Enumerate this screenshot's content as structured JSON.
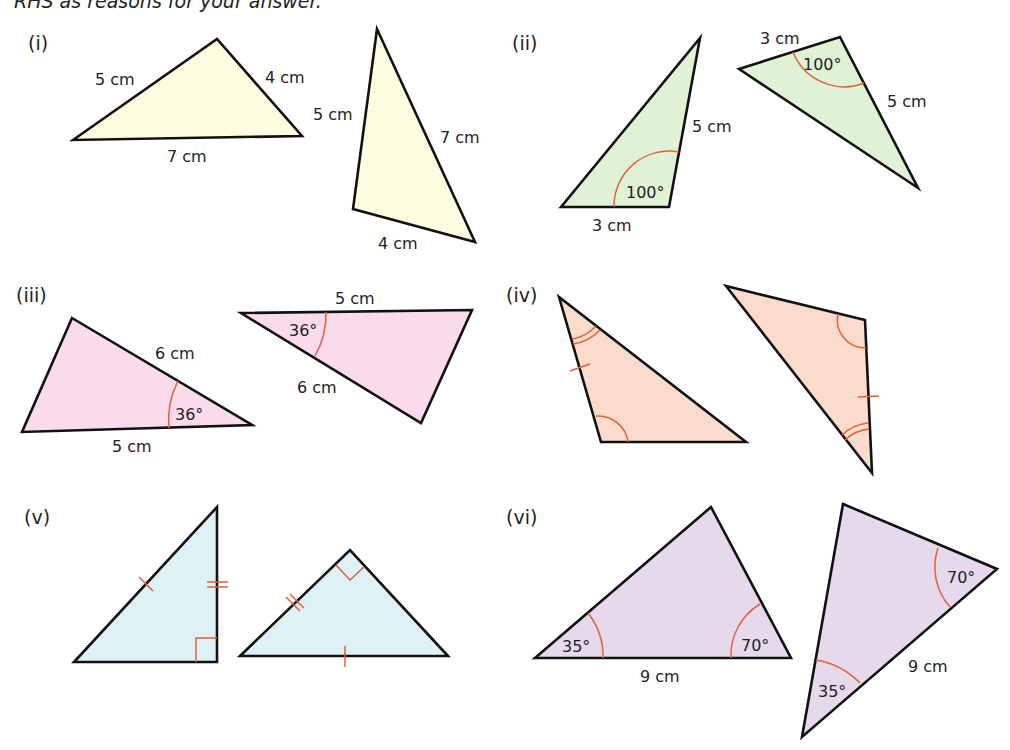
{
  "header": {
    "text": "RHS as reasons for your answer."
  },
  "colors": {
    "i": "#fdfbe0",
    "ii": "#dff2d6",
    "iii": "#f9dbec",
    "iv": "#fbdccc",
    "v": "#ddf1f7",
    "vi": "#e6d9ec",
    "edge": "#111111",
    "marker": "#e0603a"
  },
  "panels": {
    "i": {
      "label": "(i)",
      "t1": {
        "side_a": "5 cm",
        "side_b": "4 cm",
        "side_c": "7 cm"
      },
      "t2": {
        "side_a": "5 cm",
        "side_b": "7 cm",
        "side_c": "4 cm"
      }
    },
    "ii": {
      "label": "(ii)",
      "t1": {
        "side_a": "5 cm",
        "side_b": "3 cm",
        "angle": "100°"
      },
      "t2": {
        "side_a": "3 cm",
        "side_b": "5 cm",
        "angle": "100°"
      }
    },
    "iii": {
      "label": "(iii)",
      "t1": {
        "side_a": "6 cm",
        "side_b": "5 cm",
        "angle": "36°"
      },
      "t2": {
        "side_a": "5 cm",
        "side_b": "6 cm",
        "angle": "36°"
      }
    },
    "iv": {
      "label": "(iv)",
      "markers": "single arc, double arc and single tick on each triangle"
    },
    "v": {
      "label": "(v)",
      "markers": "right angle, single tick and double tick on each triangle"
    },
    "vi": {
      "label": "(vi)",
      "t1": {
        "angle_a": "35°",
        "angle_b": "70°",
        "side": "9 cm"
      },
      "t2": {
        "angle_a": "70°",
        "angle_b": "35°",
        "side": "9 cm"
      }
    }
  }
}
